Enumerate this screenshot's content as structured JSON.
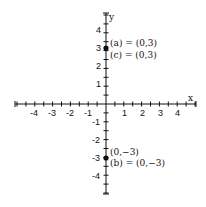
{
  "diagram": {
    "type": "coordinate-plane",
    "axes": {
      "x_label": "x",
      "y_label": "y",
      "x_ticks": [
        "-4",
        "-3",
        "-2",
        "-1",
        "1",
        "2",
        "3",
        "4"
      ],
      "y_ticks": [
        "4",
        "3",
        "2",
        "1",
        "-1",
        "-2",
        "-3",
        "-4"
      ],
      "range": [
        -5,
        5
      ]
    },
    "points": [
      {
        "x": 0,
        "y": 3,
        "labels": [
          "(a) = (0,3)",
          "(c) = (0,3)"
        ]
      },
      {
        "x": 0,
        "y": -3,
        "labels": [
          "(0,−3)",
          "(b) = (0,−3)"
        ]
      }
    ],
    "colors": {
      "ink": "#111111",
      "background": "#ffffff"
    }
  }
}
